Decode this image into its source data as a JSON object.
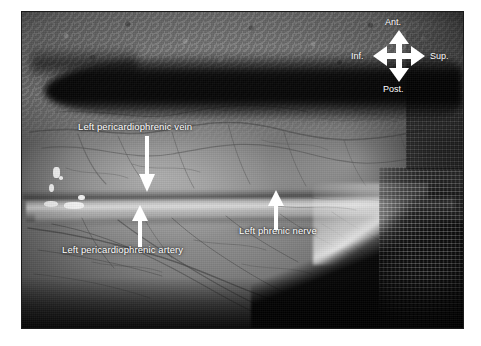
{
  "figure": {
    "type": "intraoperative-anatomical-photograph",
    "modality": "grayscale surgical photograph",
    "background_color": "#ffffff",
    "plate_border_color": "#1a1a1a",
    "annotation_color": "#ffffff"
  },
  "annotations": {
    "labels": [
      {
        "id": "left-pericardiophrenic-vein",
        "text": "Left pericardiophrenic vein",
        "x": 78,
        "y": 126,
        "arrow": {
          "direction": "down",
          "x": 146,
          "y": 141,
          "length": 50
        }
      },
      {
        "id": "left-pericardiophrenic-artery",
        "text": "Left pericardiophrenic artery",
        "x": 62,
        "y": 249,
        "arrow": {
          "direction": "up",
          "x": 139,
          "y": 207,
          "length": 38
        }
      },
      {
        "id": "left-phrenic-nerve",
        "text": "Left phrenic nerve",
        "x": 239,
        "y": 230,
        "arrow": {
          "direction": "up",
          "x": 275,
          "y": 192,
          "length": 35
        }
      }
    ]
  },
  "orientation_compass": {
    "id": "orientation-compass",
    "center_x": 399,
    "center_y": 56,
    "arm_length": 22,
    "directions": {
      "top": "Ant.",
      "bottom": "Post.",
      "left": "Inf.",
      "right": "Sup."
    }
  },
  "photo_plate": {
    "left": 22,
    "top": 12,
    "width": 441,
    "height": 316
  },
  "highlights": [
    {
      "x": 7.0,
      "y": 49.0,
      "w": 1.6,
      "h": 3.6,
      "r": "40%"
    },
    {
      "x": 6.2,
      "y": 54.5,
      "w": 1.1,
      "h": 2.4,
      "r": "50%"
    },
    {
      "x": 5.0,
      "y": 59.8,
      "w": 3.2,
      "h": 2.0,
      "r": "45%"
    },
    {
      "x": 9.6,
      "y": 60.2,
      "w": 4.4,
      "h": 2.2,
      "r": "40%"
    },
    {
      "x": 12.8,
      "y": 58.0,
      "w": 1.4,
      "h": 1.6,
      "r": "50%"
    },
    {
      "x": 8.4,
      "y": 52.0,
      "w": 1.0,
      "h": 1.2,
      "r": "50%"
    }
  ]
}
